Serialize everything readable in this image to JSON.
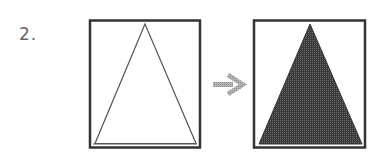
{
  "problem": {
    "number_label": "2."
  },
  "figures": {
    "before": {
      "shape": "triangle",
      "fill": "none",
      "stroke_color": "#555555"
    },
    "arrow": {
      "icon": "right-arrow-icon",
      "color": "#9a9a9a"
    },
    "after": {
      "shape": "triangle",
      "fill": "#444444",
      "stroke_color": "#333333"
    },
    "frame_color": "#333333"
  }
}
